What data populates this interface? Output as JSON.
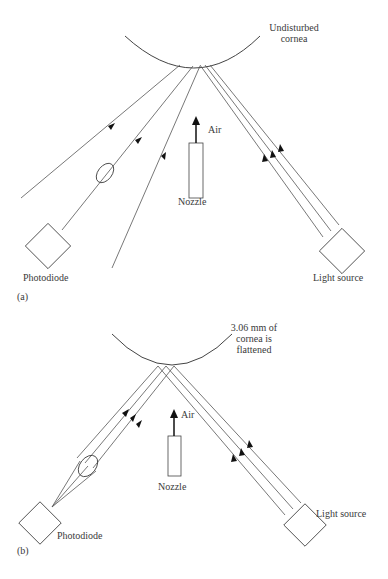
{
  "panels": [
    {
      "id": "a",
      "panel_label": "(a)",
      "cornea_label_line1": "Undisturbed",
      "cornea_label_line2": "cornea",
      "air_label": "Air",
      "nozzle_label": "Nozzle",
      "detector_label": "Photodiode",
      "source_label": "Light source"
    },
    {
      "id": "b",
      "panel_label": "(b)",
      "cornea_label_line1": "3.06 mm of",
      "cornea_label_line2": "cornea is",
      "cornea_label_line3": "flattened",
      "air_label": "Air",
      "nozzle_label": "Nozzle",
      "detector_label": "Photodiode",
      "source_label": "Light source"
    }
  ],
  "colors": {
    "line": "#555555",
    "text": "#3a3a3a",
    "background": "#ffffff"
  }
}
